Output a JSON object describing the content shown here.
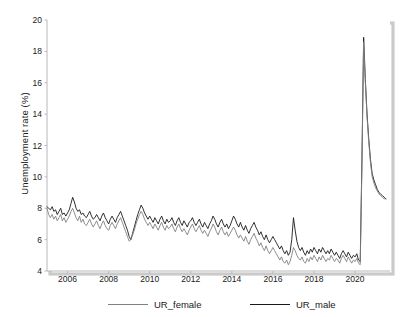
{
  "chart_data": {
    "type": "line",
    "title": "",
    "xlabel": "",
    "ylabel": "Unemployment rate (%)",
    "xlim": [
      2005.0,
      2021.7
    ],
    "ylim": [
      4,
      20
    ],
    "grid": false,
    "legend_position": "bottom",
    "xticks": [
      2006,
      2008,
      2010,
      2012,
      2014,
      2016,
      2018,
      2020
    ],
    "xtick_labels": [
      "2006",
      "2008",
      "2010",
      "2012",
      "2014",
      "2016",
      "2018",
      "2020"
    ],
    "yticks": [
      4,
      6,
      8,
      10,
      12,
      14,
      16,
      18,
      20
    ],
    "ytick_labels": [
      "4",
      "6",
      "8",
      "10",
      "12",
      "14",
      "16",
      "18",
      "20"
    ],
    "colors": {
      "UR_female": "#808080",
      "UR_male": "#1a1a1a",
      "axis": "#b8b8b8",
      "frame_shadow": "#9e9e9e",
      "text": "#1a1a1a"
    },
    "x": [
      2005.0,
      2005.083,
      2005.167,
      2005.25,
      2005.333,
      2005.417,
      2005.5,
      2005.583,
      2005.667,
      2005.75,
      2005.833,
      2005.917,
      2006.0,
      2006.083,
      2006.167,
      2006.25,
      2006.333,
      2006.417,
      2006.5,
      2006.583,
      2006.667,
      2006.75,
      2006.833,
      2006.917,
      2007.0,
      2007.083,
      2007.167,
      2007.25,
      2007.333,
      2007.417,
      2007.5,
      2007.583,
      2007.667,
      2007.75,
      2007.833,
      2007.917,
      2008.0,
      2008.083,
      2008.167,
      2008.25,
      2008.333,
      2008.417,
      2008.5,
      2008.583,
      2008.667,
      2008.75,
      2008.833,
      2008.917,
      2009.0,
      2009.083,
      2009.167,
      2009.25,
      2009.333,
      2009.417,
      2009.5,
      2009.583,
      2009.667,
      2009.75,
      2009.833,
      2009.917,
      2010.0,
      2010.083,
      2010.167,
      2010.25,
      2010.333,
      2010.417,
      2010.5,
      2010.583,
      2010.667,
      2010.75,
      2010.833,
      2010.917,
      2011.0,
      2011.083,
      2011.167,
      2011.25,
      2011.333,
      2011.417,
      2011.5,
      2011.583,
      2011.667,
      2011.75,
      2011.833,
      2011.917,
      2012.0,
      2012.083,
      2012.167,
      2012.25,
      2012.333,
      2012.417,
      2012.5,
      2012.583,
      2012.667,
      2012.75,
      2012.833,
      2012.917,
      2013.0,
      2013.083,
      2013.167,
      2013.25,
      2013.333,
      2013.417,
      2013.5,
      2013.583,
      2013.667,
      2013.75,
      2013.833,
      2013.917,
      2014.0,
      2014.083,
      2014.167,
      2014.25,
      2014.333,
      2014.417,
      2014.5,
      2014.583,
      2014.667,
      2014.75,
      2014.833,
      2014.917,
      2015.0,
      2015.083,
      2015.167,
      2015.25,
      2015.333,
      2015.417,
      2015.5,
      2015.583,
      2015.667,
      2015.75,
      2015.833,
      2015.917,
      2016.0,
      2016.083,
      2016.167,
      2016.25,
      2016.333,
      2016.417,
      2016.5,
      2016.583,
      2016.667,
      2016.75,
      2016.833,
      2016.917,
      2017.0,
      2017.083,
      2017.167,
      2017.25,
      2017.333,
      2017.417,
      2017.5,
      2017.583,
      2017.667,
      2017.75,
      2017.833,
      2017.917,
      2018.0,
      2018.083,
      2018.167,
      2018.25,
      2018.333,
      2018.417,
      2018.5,
      2018.583,
      2018.667,
      2018.75,
      2018.833,
      2018.917,
      2019.0,
      2019.083,
      2019.167,
      2019.25,
      2019.333,
      2019.417,
      2019.5,
      2019.583,
      2019.667,
      2019.75,
      2019.833,
      2019.917,
      2020.0,
      2020.083,
      2020.167,
      2020.25,
      2020.333,
      2020.417,
      2020.5,
      2020.583,
      2020.667,
      2020.75,
      2020.833,
      2020.917,
      2021.0,
      2021.083,
      2021.167,
      2021.25,
      2021.333,
      2021.417,
      2021.5
    ],
    "series": [
      {
        "name": "UR_male",
        "color": "#1a1a1a",
        "values": [
          8.1,
          8.0,
          7.9,
          8.1,
          7.8,
          7.9,
          7.6,
          7.8,
          8.0,
          7.6,
          7.7,
          7.5,
          7.7,
          7.9,
          8.3,
          8.7,
          8.4,
          8.0,
          7.8,
          7.9,
          7.6,
          7.7,
          7.5,
          7.4,
          7.6,
          7.8,
          7.5,
          7.3,
          7.4,
          7.6,
          7.4,
          7.2,
          7.5,
          7.7,
          7.4,
          7.2,
          7.0,
          7.3,
          7.5,
          7.3,
          7.1,
          7.4,
          7.6,
          7.8,
          7.5,
          7.2,
          6.9,
          6.6,
          6.2,
          6.0,
          6.4,
          6.8,
          7.2,
          7.6,
          7.9,
          8.2,
          8.0,
          7.7,
          7.5,
          7.3,
          7.5,
          7.3,
          7.1,
          7.4,
          7.2,
          7.0,
          7.3,
          7.5,
          7.2,
          7.0,
          7.3,
          7.1,
          7.2,
          7.4,
          7.1,
          6.9,
          7.2,
          7.4,
          7.1,
          6.9,
          7.2,
          7.0,
          6.8,
          7.1,
          7.2,
          7.4,
          7.1,
          6.9,
          7.1,
          7.3,
          7.0,
          6.8,
          7.1,
          6.9,
          6.7,
          7.0,
          7.2,
          7.5,
          7.3,
          7.0,
          6.8,
          7.1,
          7.3,
          7.0,
          6.8,
          7.0,
          6.7,
          6.9,
          7.2,
          7.5,
          7.3,
          7.0,
          6.8,
          7.1,
          6.8,
          6.6,
          6.9,
          6.6,
          6.4,
          6.7,
          6.9,
          7.1,
          6.8,
          6.6,
          6.3,
          6.5,
          6.2,
          6.0,
          6.3,
          6.0,
          5.8,
          6.0,
          6.2,
          6.0,
          5.8,
          5.6,
          5.4,
          5.6,
          5.3,
          5.1,
          5.3,
          5.0,
          5.2,
          6.0,
          7.4,
          6.6,
          5.9,
          5.5,
          5.3,
          5.5,
          5.2,
          5.0,
          5.3,
          5.1,
          5.4,
          5.2,
          5.5,
          5.3,
          5.1,
          5.4,
          5.2,
          5.5,
          5.3,
          5.1,
          5.3,
          5.1,
          5.4,
          5.2,
          5.0,
          5.2,
          5.0,
          4.8,
          5.1,
          5.3,
          5.1,
          4.9,
          5.2,
          5.0,
          4.8,
          5.0,
          4.9,
          5.1,
          4.7,
          4.6,
          11.0,
          18.9,
          16.2,
          14.0,
          12.4,
          11.1,
          10.2,
          9.8,
          9.5,
          9.2,
          9.0,
          8.9,
          8.8,
          8.7,
          8.6
        ]
      },
      {
        "name": "UR_female",
        "color": "#808080",
        "values": [
          8.0,
          7.6,
          7.4,
          7.6,
          7.3,
          7.5,
          7.2,
          7.4,
          7.6,
          7.2,
          7.4,
          7.1,
          7.3,
          7.5,
          7.8,
          8.0,
          7.7,
          7.4,
          7.2,
          7.5,
          7.1,
          7.3,
          7.0,
          6.9,
          7.1,
          7.3,
          7.0,
          6.8,
          7.0,
          7.2,
          6.9,
          6.7,
          7.0,
          7.2,
          6.9,
          6.7,
          6.6,
          6.9,
          7.1,
          6.9,
          6.7,
          7.0,
          7.2,
          7.4,
          7.1,
          6.8,
          6.5,
          6.2,
          5.9,
          6.0,
          6.3,
          6.6,
          7.0,
          7.3,
          7.6,
          7.8,
          7.6,
          7.3,
          7.1,
          6.9,
          7.1,
          6.9,
          6.7,
          7.0,
          6.8,
          6.6,
          6.9,
          7.1,
          6.8,
          6.6,
          6.9,
          6.7,
          6.8,
          7.0,
          6.7,
          6.5,
          6.8,
          7.0,
          6.7,
          6.5,
          6.7,
          6.5,
          6.3,
          6.6,
          6.8,
          7.0,
          6.7,
          6.5,
          6.7,
          6.9,
          6.6,
          6.4,
          6.6,
          6.4,
          6.2,
          6.5,
          6.7,
          7.0,
          6.8,
          6.5,
          6.3,
          6.6,
          6.8,
          6.5,
          6.3,
          6.5,
          6.2,
          6.4,
          6.6,
          6.8,
          6.6,
          6.3,
          6.1,
          6.3,
          6.1,
          5.9,
          6.2,
          5.9,
          5.7,
          6.0,
          6.2,
          6.4,
          6.1,
          5.9,
          5.6,
          5.8,
          5.5,
          5.3,
          5.6,
          5.3,
          5.1,
          5.3,
          5.5,
          5.3,
          5.1,
          4.9,
          4.7,
          4.9,
          4.6,
          4.5,
          4.7,
          4.4,
          4.6,
          5.0,
          5.5,
          5.3,
          5.0,
          4.8,
          4.7,
          4.9,
          4.6,
          4.5,
          4.8,
          4.6,
          4.9,
          4.7,
          5.0,
          4.8,
          4.6,
          4.9,
          4.7,
          5.0,
          4.8,
          4.6,
          4.8,
          4.7,
          5.0,
          4.8,
          4.6,
          4.8,
          4.7,
          4.5,
          4.8,
          5.0,
          4.8,
          4.6,
          4.9,
          4.7,
          4.5,
          4.7,
          4.6,
          4.8,
          4.5,
          4.4,
          10.6,
          18.6,
          16.0,
          13.8,
          12.2,
          10.9,
          10.0,
          9.6,
          9.3,
          9.1,
          8.9,
          8.8,
          8.7,
          8.6,
          8.6
        ]
      }
    ]
  }
}
